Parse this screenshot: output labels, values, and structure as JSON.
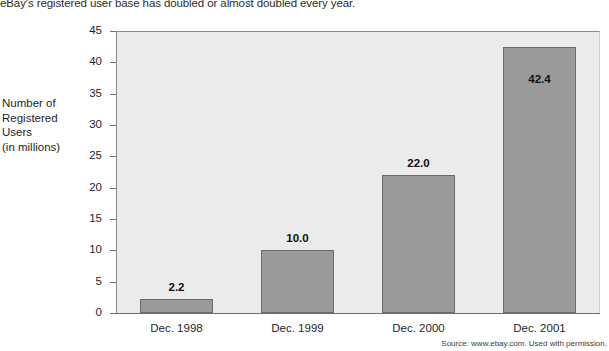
{
  "headline": "eBay's registered user base has doubled or almost doubled every year.",
  "axis_title": {
    "line1": "Number of",
    "line2": "Registered",
    "line3": "Users",
    "line4": "(in millions)"
  },
  "source": "Source: www.ebay.com. Used with permission.",
  "colors": {
    "bar_fill": "#9a9a9a",
    "bar_edge": "#6b6b6b",
    "plot_background": "#ebebeb",
    "axis": "#6e6e6e",
    "text": "#1f1f1f"
  },
  "chart_data": {
    "type": "bar",
    "title": "eBay's registered user base has doubled or almost doubled every year.",
    "categories": [
      "Dec. 1998",
      "Dec. 1999",
      "Dec. 2000",
      "Dec. 2001"
    ],
    "values": [
      2.2,
      10.0,
      22.0,
      42.4
    ],
    "data_labels": [
      "2.2",
      "10.0",
      "22.0",
      "42.4"
    ],
    "xlabel": "",
    "ylabel": "Number of Registered Users (in millions)",
    "ylim": [
      0,
      45
    ],
    "yticks": [
      0,
      5,
      10,
      15,
      20,
      25,
      30,
      35,
      40,
      45
    ],
    "ytick_labels": [
      "0",
      "5",
      "10",
      "15",
      "20",
      "25",
      "30",
      "35",
      "40",
      "45"
    ],
    "grid": false,
    "legend": false,
    "series": [
      {
        "name": "Registered users (millions)",
        "values": [
          2.2,
          10.0,
          22.0,
          42.4
        ]
      }
    ]
  }
}
